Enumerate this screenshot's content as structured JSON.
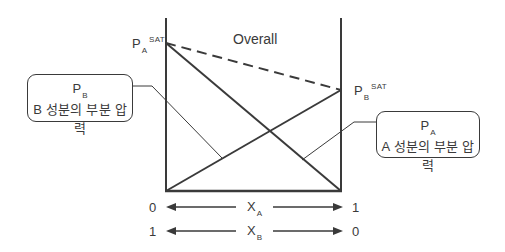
{
  "diagram": {
    "title": "Overall",
    "colors": {
      "line": "#3a3a3a",
      "background": "#ffffff"
    },
    "saturation_labels": {
      "a": {
        "symbol": "P",
        "subscript": "A",
        "superscript": "SAT"
      },
      "b": {
        "symbol": "P",
        "subscript": "B",
        "superscript": "SAT"
      }
    },
    "callouts": {
      "b": {
        "symbol": "P",
        "subscript": "B",
        "text": "B 성분의 부분 압력"
      },
      "a": {
        "symbol": "P",
        "subscript": "A",
        "text": "A 성분의 부분 압력"
      }
    },
    "axes": [
      {
        "symbol": "X",
        "subscript": "A",
        "left_value": "0",
        "right_value": "1"
      },
      {
        "symbol": "X",
        "subscript": "B",
        "left_value": "1",
        "right_value": "0"
      }
    ],
    "lines": [
      {
        "name": "overall-pressure-line",
        "style": "dashed",
        "from": "P_A^SAT",
        "to": "P_B^SAT"
      },
      {
        "name": "partial-pressure-a-line",
        "style": "solid",
        "from": "P_A^SAT at X_A=0",
        "to": "0 at X_A=1"
      },
      {
        "name": "partial-pressure-b-line",
        "style": "solid",
        "from": "0 at X_A=0",
        "to": "P_B^SAT at X_A=1"
      }
    ]
  }
}
